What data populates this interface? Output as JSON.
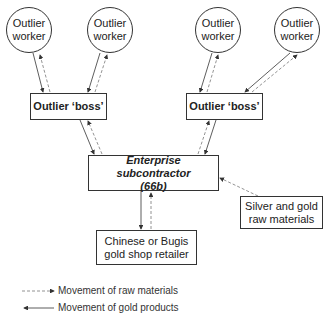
{
  "nodes": {
    "worker_1": "Outlier\nworker",
    "worker_2": "Outlier\nworker",
    "worker_3": "Outlier\nworker",
    "worker_4": "Outlier\nworker",
    "boss_left": "Outlier ‘boss’",
    "boss_right": "Outlier ‘boss’",
    "enterprise": "Enterprise subcontractor\n(66b)",
    "raw_materials": "Silver and gold\nraw materials",
    "retailer": "Chinese or Bugis\ngold shop retailer"
  },
  "legend": {
    "dashed": "Movement of raw materials",
    "solid": "Movement of gold products"
  },
  "colors": {
    "line": "#333333",
    "dashed_line": "#666666"
  }
}
